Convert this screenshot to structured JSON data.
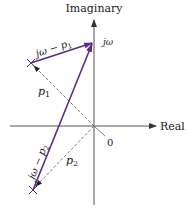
{
  "diagram": {
    "axes": {
      "vertical_label": "Imaginary",
      "horizontal_label": "Real",
      "origin_label": "0"
    },
    "points": {
      "jw": {
        "label": "jω"
      },
      "p1": {
        "label": "p",
        "sub": "1"
      },
      "p2": {
        "label": "p",
        "sub": "2"
      }
    },
    "vectors": {
      "v1": {
        "label": "jω − p",
        "sub": "1"
      },
      "v2": {
        "label": "jω − p",
        "sub": "2"
      }
    },
    "colors": {
      "vector": "#5b2a86",
      "axis": "#333333",
      "dashed": "#777777"
    }
  }
}
